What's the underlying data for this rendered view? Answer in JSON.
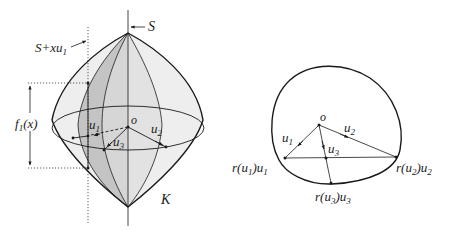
{
  "left_figure": {
    "labels": {
      "S": "S",
      "S_shift": "S+xu",
      "S_shift_sub": "1",
      "f1_name": "f",
      "f1_sub": "1",
      "f1_arg": "(x)",
      "o": "o",
      "u1": "u",
      "u1_sub": "1",
      "u2": "u",
      "u2_sub": "2",
      "u3": "u",
      "u3_sub": "3",
      "K": "K"
    }
  },
  "right_figure": {
    "labels": {
      "o": "o",
      "u1": "u",
      "u1_sub": "1",
      "u2": "u",
      "u2_sub": "2",
      "u3": "u",
      "u3_sub": "3",
      "ru1_pre": "r(u",
      "ru1_sub": "1",
      "ru1_mid": ")u",
      "ru1_sub2": "1",
      "ru2_pre": "r(u",
      "ru2_sub": "2",
      "ru2_mid": ")u",
      "ru2_sub2": "2",
      "ru3_pre": "r(u",
      "ru3_sub": "3",
      "ru3_mid": ")u",
      "ru3_sub2": "3"
    }
  },
  "colors": {
    "line": "#1a1a1a",
    "fill_light": "#e6e6e6",
    "fill_mid": "#d0d0d0",
    "fill_dark": "#b8b8b8"
  }
}
